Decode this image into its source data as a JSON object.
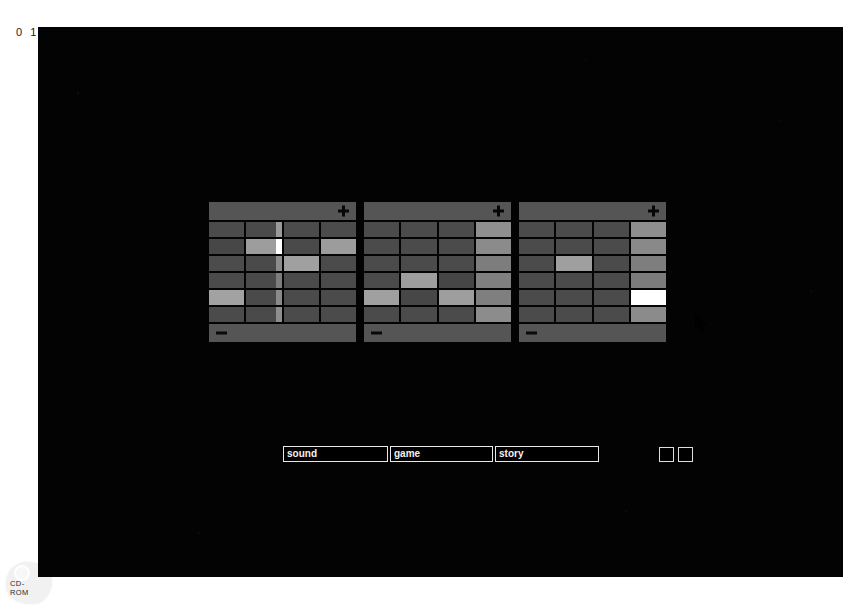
{
  "page": {
    "number_label": "0 1",
    "media_label_line1": "CD-",
    "media_label_line2": "ROM",
    "media_icon": "cd-disc-icon",
    "screen_background": "#030303"
  },
  "screen": {
    "panels": [
      {
        "name": "panel-1",
        "header": {
          "add_icon": "plus-icon",
          "add_label": "+"
        },
        "footer": {
          "remove_icon": "minus-icon",
          "remove_label": "−"
        },
        "columns": 4,
        "rows": 6,
        "cells": [
          [
            {
              "shade": "#4b4b4b"
            },
            {
              "shade": "#4a4a4a",
              "tip": "#9a9a9a"
            },
            {
              "shade": "#4b4b4b"
            },
            {
              "shade": "#4b4b4b"
            }
          ],
          [
            {
              "shade": "#474747"
            },
            {
              "shade": "#9d9d9d",
              "tip": "#ffffff"
            },
            {
              "shade": "#4a4a4a"
            },
            {
              "shade": "#9c9c9c"
            }
          ],
          [
            {
              "shade": "#4c4c4c"
            },
            {
              "shade": "#4a4a4a",
              "tip": "#8c8c8c"
            },
            {
              "shade": "#a0a0a0"
            },
            {
              "shade": "#4b4b4b"
            }
          ],
          [
            {
              "shade": "#4b4b4b"
            },
            {
              "shade": "#4a4a4a",
              "tip": "#7d7d7d"
            },
            {
              "shade": "#4b4b4b"
            },
            {
              "shade": "#4b4b4b"
            }
          ],
          [
            {
              "shade": "#a2a2a2"
            },
            {
              "shade": "#4a4a4a",
              "tip": "#8a8a8a"
            },
            {
              "shade": "#4b4b4b"
            },
            {
              "shade": "#4b4b4b"
            }
          ],
          [
            {
              "shade": "#4b4b4b"
            },
            {
              "shade": "#4a4a4a",
              "tip": "#8e8e8e"
            },
            {
              "shade": "#4b4b4b"
            },
            {
              "shade": "#4b4b4b"
            }
          ]
        ]
      },
      {
        "name": "panel-2",
        "header": {
          "add_icon": "plus-icon",
          "add_label": "+"
        },
        "footer": {
          "remove_icon": "minus-icon",
          "remove_label": "−"
        },
        "columns": 4,
        "rows": 6,
        "cells": [
          [
            {
              "shade": "#4b4b4b"
            },
            {
              "shade": "#4b4b4b"
            },
            {
              "shade": "#4b4b4b"
            },
            {
              "shade": "#8f8f8f"
            }
          ],
          [
            {
              "shade": "#4b4b4b"
            },
            {
              "shade": "#4b4b4b"
            },
            {
              "shade": "#4b4b4b"
            },
            {
              "shade": "#8b8b8b"
            }
          ],
          [
            {
              "shade": "#4b4b4b"
            },
            {
              "shade": "#4b4b4b"
            },
            {
              "shade": "#4b4b4b"
            },
            {
              "shade": "#7d7d7d"
            }
          ],
          [
            {
              "shade": "#4b4b4b"
            },
            {
              "shade": "#9e9e9e"
            },
            {
              "shade": "#464646"
            },
            {
              "shade": "#808080"
            }
          ],
          [
            {
              "shade": "#a0a0a0"
            },
            {
              "shade": "#474747"
            },
            {
              "shade": "#9e9e9e"
            },
            {
              "shade": "#7f7f7f"
            }
          ],
          [
            {
              "shade": "#4b4b4b"
            },
            {
              "shade": "#4b4b4b"
            },
            {
              "shade": "#4b4b4b"
            },
            {
              "shade": "#8c8c8c"
            }
          ]
        ]
      },
      {
        "name": "panel-3",
        "header": {
          "add_icon": "plus-icon",
          "add_label": "+"
        },
        "footer": {
          "remove_icon": "minus-icon",
          "remove_label": "−"
        },
        "columns": 4,
        "rows": 6,
        "cells": [
          [
            {
              "shade": "#4b4b4b"
            },
            {
              "shade": "#4b4b4b"
            },
            {
              "shade": "#4b4b4b"
            },
            {
              "shade": "#8e8e8e"
            }
          ],
          [
            {
              "shade": "#4b4b4b"
            },
            {
              "shade": "#4b4b4b"
            },
            {
              "shade": "#4b4b4b"
            },
            {
              "shade": "#898989"
            }
          ],
          [
            {
              "shade": "#4b4b4b"
            },
            {
              "shade": "#9f9f9f"
            },
            {
              "shade": "#4b4b4b"
            },
            {
              "shade": "#7e7e7e"
            }
          ],
          [
            {
              "shade": "#4b4b4b"
            },
            {
              "shade": "#4b4b4b"
            },
            {
              "shade": "#4b4b4b"
            },
            {
              "shade": "#7c7c7c"
            }
          ],
          [
            {
              "shade": "#4b4b4b"
            },
            {
              "shade": "#4b4b4b"
            },
            {
              "shade": "#4b4b4b"
            },
            {
              "shade": "#ffffff",
              "selected": true
            }
          ],
          [
            {
              "shade": "#4b4b4b"
            },
            {
              "shade": "#4b4b4b"
            },
            {
              "shade": "#4b4b4b"
            },
            {
              "shade": "#8b8b8b"
            }
          ]
        ]
      }
    ],
    "fields": [
      {
        "name": "sound",
        "value": "sound",
        "placeholder": "sound"
      },
      {
        "name": "game",
        "value": "game",
        "placeholder": "game"
      },
      {
        "name": "story",
        "value": "story",
        "placeholder": "story"
      }
    ],
    "toggles": [
      {
        "name": "toggle-1",
        "checked": false
      },
      {
        "name": "toggle-2",
        "checked": false
      }
    ],
    "cursor": {
      "icon": "arrow-pointer-icon",
      "x": 657,
      "y": 287
    }
  },
  "colors": {
    "panel_bar": "#555555",
    "cell_default": "#4b4b4b",
    "cell_highlight": "#a0a0a0",
    "cell_selected": "#ffffff",
    "field_border": "#e8e8e8",
    "field_text": "#f2f2f2"
  }
}
